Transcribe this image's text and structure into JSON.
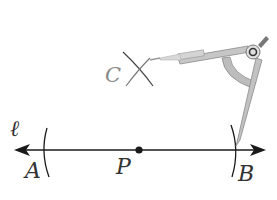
{
  "diagram": {
    "type": "compass-construction",
    "line": {
      "label": "ℓ",
      "color": "#1a1a1a"
    },
    "points": [
      {
        "id": "A",
        "label": "A"
      },
      {
        "id": "P",
        "label": "P"
      },
      {
        "id": "B",
        "label": "B"
      },
      {
        "id": "C",
        "label": "C"
      }
    ],
    "tool": "compass",
    "colors": {
      "ink": "#1a1a1a",
      "label": "#333333",
      "label_c": "#8a8a8a",
      "compass_metal": "#b8b8b8",
      "compass_dark": "#555555"
    }
  }
}
